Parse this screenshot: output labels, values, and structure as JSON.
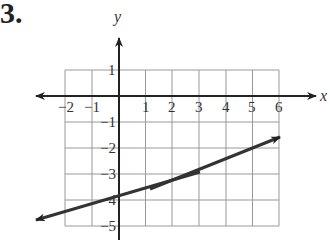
{
  "problem": {
    "number": "3."
  },
  "axes": {
    "x_label": "x",
    "y_label": "y",
    "x_ticks": [
      "−2",
      "−1",
      "1",
      "2",
      "3",
      "4",
      "5",
      "6"
    ],
    "y_ticks": [
      "1",
      "−1",
      "−2",
      "−3",
      "−4",
      "−5"
    ]
  },
  "grid": {
    "x_min": -2,
    "x_max": 6,
    "y_min": -5,
    "y_max": 1
  },
  "line": {
    "equation": "y = (1/3)x − 4",
    "slope": 0.3333,
    "y_intercept": -4,
    "from": [
      -2.3,
      -4.77
    ],
    "to": [
      6.0,
      -2.0
    ],
    "color": "#333333"
  }
}
